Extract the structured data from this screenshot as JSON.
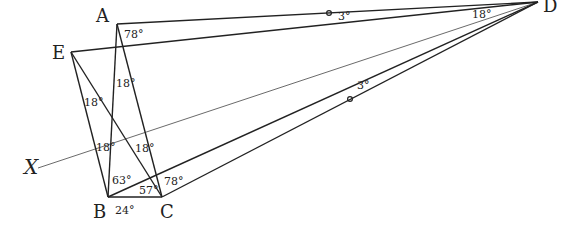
{
  "diagram": {
    "type": "geometry",
    "points": [
      {
        "name": "A",
        "label": "A",
        "x": 117,
        "y": 24,
        "lx": 96,
        "ly": 22
      },
      {
        "name": "E",
        "label": "E",
        "x": 71,
        "y": 52,
        "lx": 52,
        "ly": 59
      },
      {
        "name": "B",
        "label": "B",
        "x": 108,
        "y": 197,
        "lx": 93,
        "ly": 218
      },
      {
        "name": "C",
        "label": "C",
        "x": 162,
        "y": 197,
        "lx": 160,
        "ly": 218
      },
      {
        "name": "D",
        "label": "D",
        "x": 538,
        "y": 2,
        "lx": 543,
        "ly": 12
      },
      {
        "name": "X",
        "label": "X",
        "x": 38,
        "y": 168,
        "lx": 24,
        "ly": 174
      }
    ],
    "segments": [
      [
        "A",
        "D"
      ],
      [
        "E",
        "D"
      ],
      [
        "A",
        "B"
      ],
      [
        "A",
        "C"
      ],
      [
        "E",
        "B"
      ],
      [
        "E",
        "C"
      ],
      [
        "B",
        "C"
      ],
      [
        "B",
        "D"
      ],
      [
        "C",
        "D"
      ]
    ],
    "thin_lines": [
      [
        "X",
        "D"
      ]
    ],
    "angle_labels": [
      {
        "text": "78°",
        "x": 124,
        "y": 38
      },
      {
        "text": "18°",
        "x": 116,
        "y": 87
      },
      {
        "text": "18°",
        "x": 84,
        "y": 106
      },
      {
        "text": "18°",
        "x": 96,
        "y": 151
      },
      {
        "text": "18°",
        "x": 135,
        "y": 152
      },
      {
        "text": "63°",
        "x": 112,
        "y": 184
      },
      {
        "text": "57°",
        "x": 139,
        "y": 194
      },
      {
        "text": "78°",
        "x": 164,
        "y": 185
      },
      {
        "text": "24°",
        "x": 115,
        "y": 214
      },
      {
        "text": "3°",
        "x": 338,
        "y": 20
      },
      {
        "text": "18°",
        "x": 472,
        "y": 18
      },
      {
        "text": "3°",
        "x": 357,
        "y": 89
      }
    ],
    "markers": [
      {
        "x": 329,
        "y": 13
      },
      {
        "x": 350,
        "y": 99
      }
    ]
  }
}
